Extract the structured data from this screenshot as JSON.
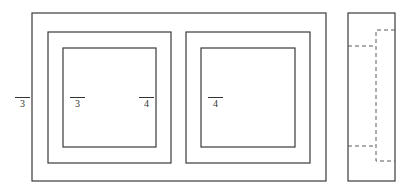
{
  "diagram": {
    "type": "window-frame-elevation",
    "front_view": {
      "outer_frame": {
        "x": 32,
        "y": 13,
        "w": 294,
        "h": 168
      },
      "panels": [
        {
          "name": "left-sash",
          "sash": {
            "x": 48,
            "y": 32,
            "w": 123,
            "h": 131
          },
          "glass": {
            "x": 63,
            "y": 48,
            "w": 93,
            "h": 99
          }
        },
        {
          "name": "right-sash",
          "sash": {
            "x": 186,
            "y": 32,
            "w": 124,
            "h": 131
          },
          "glass": {
            "x": 201,
            "y": 48,
            "w": 94,
            "h": 99
          }
        }
      ]
    },
    "side_view": {
      "frame": {
        "x": 348,
        "y": 13,
        "w": 47,
        "h": 168
      },
      "hidden_line_color": "#5a5a5a"
    },
    "labels": [
      {
        "text": "3",
        "x": 15,
        "y": 97
      },
      {
        "text": "3",
        "x": 70,
        "y": 97
      },
      {
        "text": "4",
        "x": 139,
        "y": 97
      },
      {
        "text": "4",
        "x": 208,
        "y": 97
      }
    ],
    "line_color": "#3a3a3a"
  }
}
